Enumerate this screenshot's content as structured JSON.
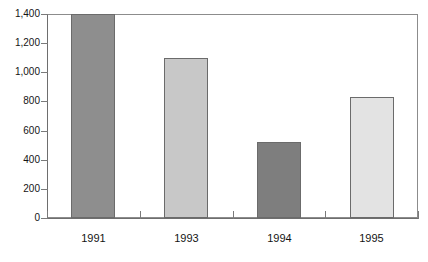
{
  "chart_data": {
    "type": "bar",
    "title": "",
    "xlabel": "",
    "ylabel": "",
    "categories": [
      "1991",
      "1993",
      "1994",
      "1995"
    ],
    "values": [
      1400,
      1100,
      520,
      830
    ],
    "ylim": [
      0,
      1400
    ],
    "ytick_values": [
      0,
      200,
      400,
      600,
      800,
      1000,
      1200,
      1400
    ],
    "ytick_labels": [
      "0",
      "200",
      "400",
      "600",
      "800",
      "1,000",
      "1,200",
      "1,400"
    ],
    "grid": false,
    "legend": "none",
    "bar_colors": [
      "#8e8e8e",
      "#c8c8c8",
      "#7e7e7e",
      "#e3e3e3"
    ],
    "bar_border_color": "#6b6b6b",
    "axis_color": "#6e6e6e",
    "frame_color": "#8c8c8c",
    "background": "#ffffff",
    "bars": [
      {
        "category": "1991",
        "value": 1400,
        "label": "1991",
        "color": "#8e8e8e"
      },
      {
        "category": "1993",
        "value": 1100,
        "label": "1993",
        "color": "#c8c8c8"
      },
      {
        "category": "1994",
        "value": 520,
        "label": "1994",
        "color": "#7e7e7e"
      },
      {
        "category": "1995",
        "value": 830,
        "label": "1995",
        "color": "#e3e3e3"
      }
    ]
  },
  "title_sliver": {
    "text": ""
  }
}
